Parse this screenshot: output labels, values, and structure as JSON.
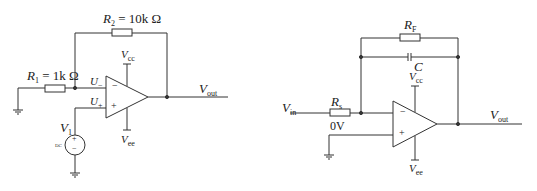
{
  "left_circuit": {
    "r2": {
      "sym": "R",
      "sub": "2",
      "value": " = 10k Ω"
    },
    "r1": {
      "sym": "R",
      "sub": "1",
      "value": " = 1k Ω"
    },
    "u_minus": {
      "sym": "U",
      "sub": "−"
    },
    "u_plus": {
      "sym": "U",
      "sub": "+"
    },
    "vcc": {
      "sym": "V",
      "sub": "cc"
    },
    "vee": {
      "sym": "V",
      "sub": "ee"
    },
    "vout": {
      "sym": "V",
      "sub": "out"
    },
    "v1": {
      "sym": "V",
      "sub": "1"
    },
    "dc": "DC",
    "minus_sign": "−",
    "plus_sign": "+"
  },
  "right_circuit": {
    "rf": {
      "sym": "R",
      "sub": "F"
    },
    "c": {
      "sym": "C"
    },
    "vcc": {
      "sym": "V",
      "sub": "cc"
    },
    "vee": {
      "sym": "V",
      "sub": "ee"
    },
    "vin": {
      "sym": "V",
      "sub": "in"
    },
    "rs": {
      "sym": "R",
      "sub": "s"
    },
    "zero_v": "0V",
    "vout": {
      "sym": "V",
      "sub": "out"
    },
    "minus_sign": "−",
    "plus_sign": "+"
  }
}
